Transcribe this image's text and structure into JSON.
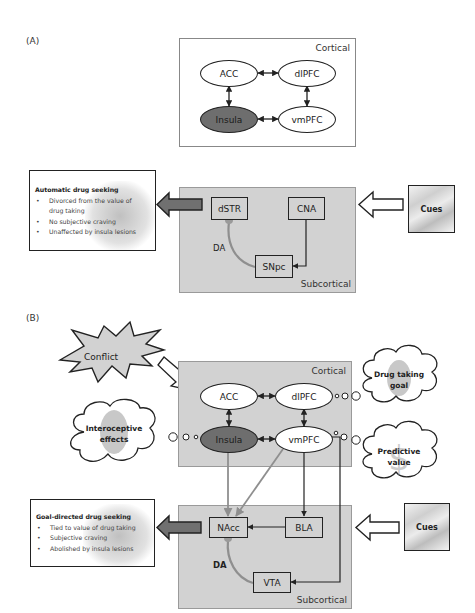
{
  "panel_a": {
    "label": "(A)",
    "cortical": {
      "label": "Cortical",
      "nodes": {
        "acc": "ACC",
        "dlpfc": "dlPFC",
        "insula": "Insula",
        "vmpfc": "vmPFC"
      }
    },
    "subcortical": {
      "label": "Subcortical",
      "nodes": {
        "dstr": "dSTR",
        "cna": "CNA",
        "snpc": "SNpc"
      },
      "da_label": "DA"
    },
    "outcome_box": {
      "title": "Automatic drug seeking",
      "bullets": [
        "Divorced from the value of",
        "No subjective craving",
        "Unaffected by insula lesions"
      ],
      "bullet_1_cont": "drug taking"
    },
    "cues_label": "Cues"
  },
  "panel_b": {
    "label": "(B)",
    "conflict_label": "Conflict",
    "cortical": {
      "label": "Cortical",
      "nodes": {
        "acc": "ACC",
        "dlpfc": "dlPFC",
        "insula": "Insula",
        "vmpfc": "vmPFC"
      }
    },
    "subcortical": {
      "label": "Subcortical",
      "nodes": {
        "nacc": "NAcc",
        "bla": "BLA",
        "vta": "VTA"
      },
      "da_label": "DA"
    },
    "clouds": {
      "drug_goal": {
        "line1": "Drug taking",
        "line2": "goal"
      },
      "interoceptive": {
        "line1": "Interoceptive",
        "line2": "effects"
      },
      "predictive": {
        "line1": "Predictive",
        "line2": "value"
      }
    },
    "outcome_box": {
      "title": "Goal-directed drug seeking",
      "bullets": [
        "Tied to value of drug taking",
        "Subjective craving",
        "Abolished by insula lesions"
      ]
    },
    "cues_label": "Cues"
  },
  "colors": {
    "insula_fill": "#6e6e6e",
    "region_gray": "#d2d2d2",
    "da_pathway": "#8f8f8f",
    "da_terminal": "#9a9a9a",
    "output_arrow": "#707070"
  }
}
